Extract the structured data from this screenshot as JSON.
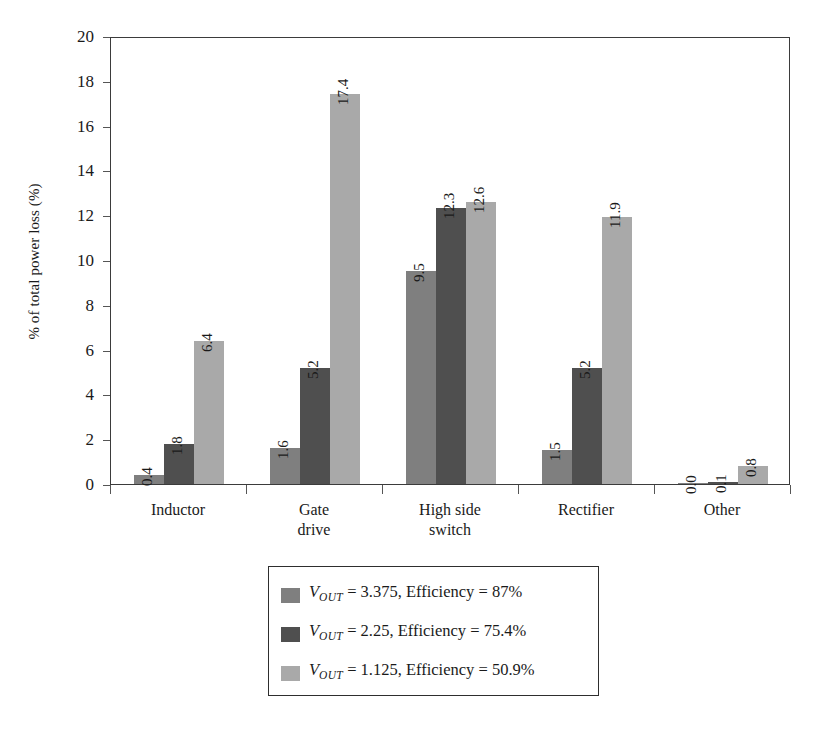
{
  "chart_data": {
    "type": "bar",
    "title": "",
    "subtitle": "",
    "xlabel": "",
    "ylabel": "% of total power loss (%)",
    "ylim": [
      0,
      20
    ],
    "ytick_step": 2,
    "yticks": [
      "0",
      "2",
      "4",
      "6",
      "8",
      "10",
      "12",
      "14",
      "16",
      "18",
      "20"
    ],
    "grid": false,
    "legend_position": "bottom-center",
    "categories": [
      "Inductor",
      "Gate\ndrive",
      "High side\nswitch",
      "Rectifier",
      "Other"
    ],
    "series": [
      {
        "name": "VOUT = 3.375, Efficiency = 87%",
        "color": "#7f7f7f",
        "values": [
          0.4,
          1.6,
          9.5,
          1.5,
          0.0
        ],
        "labels": [
          "0.4",
          "1.6",
          "9.5",
          "1.5",
          "0.0"
        ]
      },
      {
        "name": "VOUT = 2.25, Efficiency = 75.4%",
        "color": "#4f4f4f",
        "values": [
          1.8,
          5.2,
          12.3,
          5.2,
          0.1
        ],
        "labels": [
          "1.8",
          "5.2",
          "12.3",
          "5.2",
          "0.1"
        ]
      },
      {
        "name": "VOUT = 1.125, Efficiency = 50.9%",
        "color": "#a9a9a9",
        "values": [
          6.4,
          17.4,
          12.6,
          11.9,
          0.8
        ],
        "labels": [
          "6.4",
          "17.4",
          "12.6",
          "11.9",
          "0.8"
        ]
      }
    ]
  },
  "legend": {
    "entries": [
      {
        "symbol": "V",
        "subscript": "OUT",
        "text": " = 3.375, Efficiency = 87%",
        "color": "#7f7f7f"
      },
      {
        "symbol": "V",
        "subscript": "OUT",
        "text": " = 2.25, Efficiency = 75.4%",
        "color": "#4f4f4f"
      },
      {
        "symbol": "V",
        "subscript": "OUT",
        "text": " = 1.125, Efficiency = 50.9%",
        "color": "#a9a9a9"
      }
    ]
  },
  "axis": {
    "y_title": "% of total power loss (%)"
  }
}
